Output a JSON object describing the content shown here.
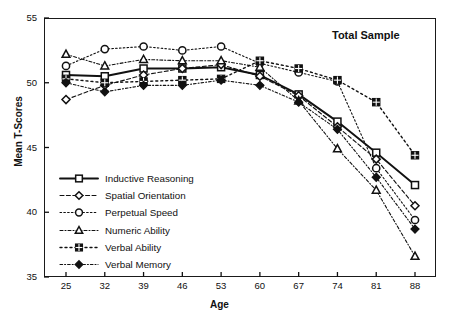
{
  "chart_data": {
    "type": "line",
    "title": "Total Sample",
    "xlabel": "Age",
    "ylabel": "Mean T-Scores",
    "x": [
      25,
      32,
      39,
      46,
      53,
      60,
      67,
      74,
      81,
      88
    ],
    "xticks": [
      "25",
      "32",
      "39",
      "46",
      "53",
      "60",
      "67",
      "74",
      "81",
      "88"
    ],
    "yticks": [
      "35",
      "40",
      "45",
      "50",
      "55"
    ],
    "xlim": [
      21.5,
      91.5
    ],
    "ylim": [
      35,
      55
    ],
    "grid": false,
    "legend_position": "lower-left-inside",
    "series": [
      {
        "name": "Inductive Reasoning",
        "marker": "open-square",
        "linestyle": "solid",
        "values": [
          50.6,
          50.5,
          51.1,
          51.1,
          51.2,
          50.6,
          49.1,
          47.0,
          44.6,
          42.1
        ]
      },
      {
        "name": "Spatial Orientation",
        "marker": "open-diamond",
        "linestyle": "dashed",
        "values": [
          48.7,
          49.8,
          50.6,
          51.1,
          51.4,
          50.5,
          49.0,
          46.6,
          44.1,
          40.5
        ]
      },
      {
        "name": "Perpetual Speed",
        "marker": "open-circle",
        "linestyle": "dotted",
        "values": [
          51.3,
          52.6,
          52.8,
          52.5,
          52.8,
          51.5,
          50.8,
          50.1,
          43.4,
          39.4
        ]
      },
      {
        "name": "Numeric Ability",
        "marker": "open-triangle",
        "linestyle": "dash-dot",
        "values": [
          52.2,
          51.3,
          51.8,
          51.7,
          51.7,
          51.2,
          48.6,
          44.9,
          41.7,
          36.6
        ]
      },
      {
        "name": "Verbal Ability",
        "marker": "filled-grid-square",
        "linestyle": "dotted-wide",
        "values": [
          50.3,
          50.0,
          50.1,
          50.2,
          50.3,
          51.7,
          51.1,
          50.2,
          48.5,
          44.4
        ]
      },
      {
        "name": "Verbal Memory",
        "marker": "filled-diamond",
        "linestyle": "dash-dot-fine",
        "values": [
          50.0,
          49.3,
          49.8,
          49.8,
          50.2,
          49.8,
          48.5,
          46.4,
          42.7,
          38.7
        ]
      }
    ]
  },
  "colors": {
    "ink": "#111111",
    "axis": "#1a1a1a",
    "background": "#ffffff"
  }
}
